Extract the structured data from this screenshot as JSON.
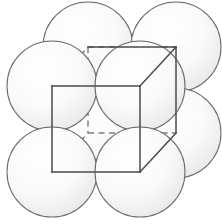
{
  "figure": {
    "canvas": {
      "width": 222,
      "height": 224,
      "background": "#ffffff"
    },
    "style": {
      "sphere_fill_center": "#ffffff",
      "sphere_fill_edge": "#e8e8e8",
      "sphere_stroke": "#6b6b6b",
      "cube_visible_stroke": "#4a4a4a",
      "cube_hidden_stroke": "#7d7d7d",
      "cube_stroke_width": 1.5,
      "sphere_stroke_width": 1.05,
      "hidden_dash_pattern": "6 4.5"
    }
  },
  "geometry": {
    "sphere_radius": 45,
    "projection": {
      "depth_dx": 36,
      "depth_dy": -39
    },
    "cube_vertices": {
      "front_top_left": {
        "x": 52,
        "y": 86,
        "label": "front-top-left"
      },
      "front_top_right": {
        "x": 140,
        "y": 86,
        "label": "front-top-right"
      },
      "front_bottom_right": {
        "x": 140,
        "y": 172,
        "label": "front-bottom-right"
      },
      "front_bottom_left": {
        "x": 52,
        "y": 172,
        "label": "front-bottom-left"
      },
      "back_top_left": {
        "x": 88,
        "y": 47,
        "label": "back-top-left"
      },
      "back_top_right": {
        "x": 176,
        "y": 47,
        "label": "back-top-right"
      },
      "back_bottom_right": {
        "x": 176,
        "y": 133,
        "label": "back-bottom-right"
      },
      "back_bottom_left": {
        "x": 88,
        "y": 133,
        "label": "back-bottom-left"
      }
    },
    "spheres": [
      {
        "id": "sphere-back-top-left",
        "cx": 88,
        "cy": 47,
        "r": 45,
        "corner": "back-top-left"
      },
      {
        "id": "sphere-back-top-right",
        "cx": 176,
        "cy": 47,
        "r": 45,
        "corner": "back-top-right"
      },
      {
        "id": "sphere-front-top-left",
        "cx": 52,
        "cy": 86,
        "r": 45,
        "corner": "front-top-left"
      },
      {
        "id": "sphere-front-top-right",
        "cx": 140,
        "cy": 86,
        "r": 45,
        "corner": "front-top-right"
      },
      {
        "id": "sphere-back-bottom-left",
        "cx": 88,
        "cy": 133,
        "r": 45,
        "corner": "back-bottom-left"
      },
      {
        "id": "sphere-back-bottom-right",
        "cx": 176,
        "cy": 133,
        "r": 45,
        "corner": "back-bottom-right"
      },
      {
        "id": "sphere-front-bottom-left",
        "cx": 52,
        "cy": 172,
        "r": 45,
        "corner": "front-bottom-left"
      },
      {
        "id": "sphere-front-bottom-right",
        "cx": 140,
        "cy": 172,
        "r": 45,
        "corner": "front-bottom-right"
      }
    ],
    "edges_visible": [
      {
        "id": "edge-front-top",
        "from": "front_top_left",
        "to": "front_top_right"
      },
      {
        "id": "edge-front-right",
        "from": "front_top_right",
        "to": "front_bottom_right"
      },
      {
        "id": "edge-front-bottom",
        "from": "front_bottom_right",
        "to": "front_bottom_left"
      },
      {
        "id": "edge-front-left",
        "from": "front_bottom_left",
        "to": "front_top_left"
      },
      {
        "id": "edge-top-right-depth",
        "from": "front_top_right",
        "to": "back_top_right"
      },
      {
        "id": "edge-bottom-right-depth",
        "from": "front_bottom_right",
        "to": "back_bottom_right"
      },
      {
        "id": "edge-back-right",
        "from": "back_top_right",
        "to": "back_bottom_right"
      },
      {
        "id": "edge-back-top",
        "from": "back_top_left",
        "to": "back_top_right"
      }
    ],
    "edges_hidden": [
      {
        "id": "edge-top-left-depth",
        "from": "front_top_left",
        "to": "back_top_left"
      },
      {
        "id": "edge-back-top-dashed",
        "from": "back_top_left",
        "to": "back_top_right"
      },
      {
        "id": "edge-back-left",
        "from": "back_top_left",
        "to": "back_bottom_left"
      },
      {
        "id": "edge-back-bottom",
        "from": "back_bottom_left",
        "to": "back_bottom_right"
      },
      {
        "id": "edge-bottom-left-depth",
        "from": "front_bottom_left",
        "to": "back_bottom_left"
      }
    ]
  }
}
